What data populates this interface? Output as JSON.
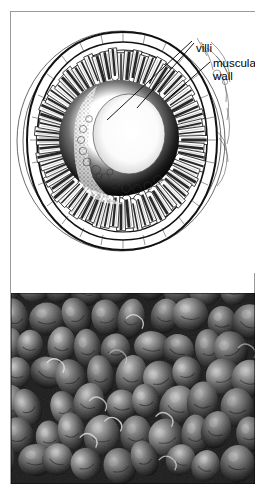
{
  "figure": {
    "panels": [
      {
        "name": "line-drawing",
        "type": "pen-and-ink cross-section",
        "subject": "small intestine transverse section showing villi lining the lumen and the surrounding muscular wall",
        "labels": [
          {
            "id": "villi",
            "text": "villi",
            "leader_lines": 2
          },
          {
            "id": "muscular-wall",
            "text_line_1": "muscular",
            "text_line_2": "wall",
            "leader_lines": 1
          }
        ]
      },
      {
        "name": "sem-micrograph",
        "type": "scanning electron micrograph",
        "subject": "densely packed dome-shaped intestinal villi",
        "tone": "grayscale"
      }
    ]
  },
  "labels": {
    "villi": "villi",
    "muscular": "muscular",
    "wall": "wall"
  },
  "colors": {
    "frame": "#9a9a9a",
    "ink": "#000000",
    "paper": "#ffffff",
    "sem_dark": "#1d1d1d",
    "sem_mid": "#6a6a6a",
    "sem_light": "#b6b6b6"
  }
}
